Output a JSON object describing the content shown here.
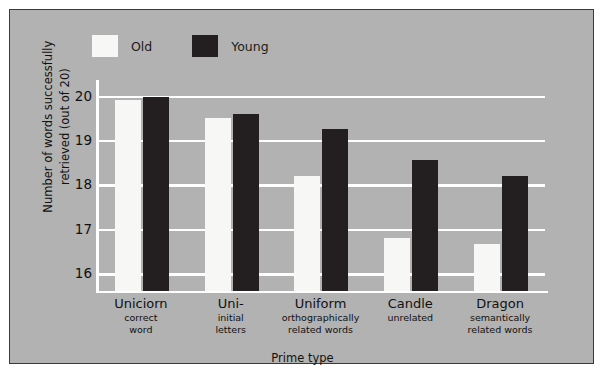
{
  "chart_data": {
    "type": "bar",
    "title": "",
    "xlabel": "Prime type",
    "ylabel": "Number of words successfully retrieved (out of 20)",
    "ylabel_line1": "Number of words successfully",
    "ylabel_line2": "retrieved (out of 20)",
    "ylim": [
      15.6,
      20.35
    ],
    "yticks": [
      20,
      19,
      18,
      17,
      16
    ],
    "ytick_labels": [
      "20",
      "19",
      "18",
      "17",
      "16"
    ],
    "grid": "horizontal",
    "legend_position": "top-left",
    "categories": [
      "Uniciorn",
      "Uni-",
      "Uniform",
      "Candle",
      "Dragon"
    ],
    "category_sublabels": [
      [
        "correct",
        "word"
      ],
      [
        "initial",
        "letters"
      ],
      [
        "orthographically",
        "related words"
      ],
      [
        "unrelated"
      ],
      [
        "semantically",
        "related words"
      ]
    ],
    "series": [
      {
        "name": "Old",
        "color": "#f7f7f5",
        "values": [
          19.9,
          19.5,
          18.2,
          16.8,
          16.65
        ]
      },
      {
        "name": "Young",
        "color": "#231f20",
        "values": [
          19.97,
          19.58,
          19.25,
          18.55,
          18.2
        ]
      }
    ]
  },
  "legend": {
    "items": [
      {
        "label": "Old",
        "swatch": "old-swatch"
      },
      {
        "label": "Young",
        "swatch": "young-swatch"
      }
    ]
  },
  "colors": {
    "panel_background": "#b2b2b2",
    "gridline": "#ffffff",
    "axis": "#ffffff",
    "border": "#3a3a3a",
    "text": "#111111",
    "old_bar": "#f7f7f5",
    "young_bar": "#231f20"
  }
}
